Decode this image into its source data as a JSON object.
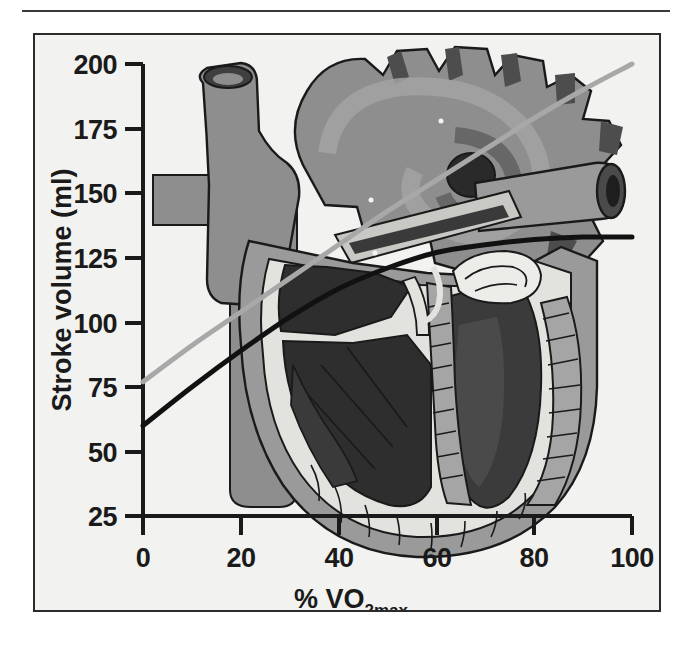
{
  "figure": {
    "background_color": "#f2f2f0",
    "border_color": "#2b2b2b",
    "rule_color": "#3a3a3a"
  },
  "chart_data": {
    "type": "line",
    "title": "",
    "subtitle": "",
    "xlabel": "% VO2max",
    "xlabel_main": "% VO",
    "xlabel_sub": "2max",
    "ylabel": "Stroke volume (ml)",
    "xlim": [
      0,
      100
    ],
    "ylim": [
      25,
      200
    ],
    "xticks": [
      0,
      20,
      40,
      60,
      80,
      100
    ],
    "xtick_labels": [
      "0",
      "20",
      "40",
      "60",
      "80",
      "100"
    ],
    "yticks": [
      25,
      50,
      75,
      100,
      125,
      150,
      175,
      200
    ],
    "ytick_labels": [
      "25",
      "50",
      "75",
      "100",
      "125",
      "150",
      "175",
      "200"
    ],
    "grid": false,
    "legend": false,
    "legend_position": "none",
    "background_image": "anatomical-heart-cutaway-illustration",
    "series": [
      {
        "name": "trained",
        "color": "#a8a8a8",
        "line_width": 5,
        "x": [
          0,
          10,
          20,
          30,
          40,
          50,
          60,
          70,
          80,
          90,
          100
        ],
        "y": [
          77,
          91,
          104,
          117,
          130,
          143,
          155,
          167,
          179,
          190,
          200
        ]
      },
      {
        "name": "untrained",
        "color": "#111111",
        "line_width": 5,
        "x": [
          0,
          10,
          20,
          30,
          40,
          50,
          60,
          70,
          80,
          90,
          100
        ],
        "y": [
          60,
          75,
          89,
          102,
          113,
          121,
          127,
          130,
          132,
          133,
          133
        ]
      }
    ]
  },
  "heart": {
    "name": "anatomical-heart-illustration",
    "colors": {
      "aorta_gray": "#8e8e8e",
      "aorta_dark": "#4a4a4a",
      "myocardium_mid": "#9a9a9a",
      "chamber_dark": "#2e2e2e",
      "chamber_deep": "#3b3b3b",
      "endocardium_light": "#e2e2de",
      "papillary_gray": "#a5a5a5",
      "outline": "#1a1a1a",
      "vessel_light": "#b4b4b4"
    }
  }
}
